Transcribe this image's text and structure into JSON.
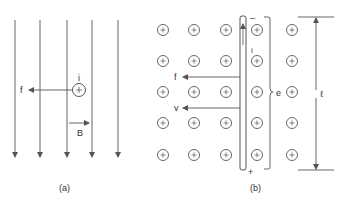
{
  "panel_a": {
    "caption": "(a)",
    "field_label": "B",
    "current_label": "i",
    "force_label": "f",
    "current_symbol": "+",
    "field_lines": 5
  },
  "panel_b": {
    "caption": "(b)",
    "force_label": "f",
    "velocity_label": "v",
    "current_label": "i",
    "emf_label": "e",
    "length_label": "ℓ",
    "rod_top_polarity": "–",
    "rod_bottom_polarity": "+",
    "field_symbol": "+",
    "grid_rows": 5,
    "grid_cols": 5
  },
  "colors": {
    "stroke": "#555555",
    "text": "#333333",
    "background": "#ffffff"
  }
}
